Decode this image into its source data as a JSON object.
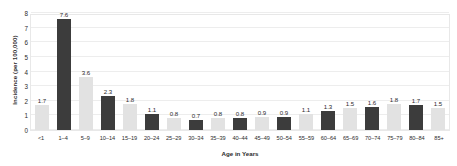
{
  "chart_data": {
    "type": "bar",
    "title": "",
    "xlabel": "Age in Years",
    "ylabel": "Incidence (per 100,000)",
    "ylim": [
      0,
      8
    ],
    "yticks": [
      0,
      1,
      2,
      3,
      4,
      5,
      6,
      7,
      8
    ],
    "grid": true,
    "legend": "none",
    "categories": [
      "<1",
      "1–4",
      "5–9",
      "10–14",
      "15–19",
      "20–24",
      "25–29",
      "30–34",
      "35–39",
      "40–44",
      "45–49",
      "50–54",
      "55–59",
      "60–64",
      "65–69",
      "70–74",
      "75–79",
      "80–84",
      "85+"
    ],
    "values": [
      1.7,
      7.6,
      3.6,
      2.3,
      1.8,
      1.1,
      0.8,
      0.7,
      0.8,
      0.8,
      0.9,
      0.9,
      1.1,
      1.3,
      1.5,
      1.6,
      1.8,
      1.7,
      1.5
    ],
    "bar_colors": [
      "light",
      "dark",
      "light",
      "dark",
      "light",
      "dark",
      "light",
      "dark",
      "light",
      "dark",
      "light",
      "dark",
      "light",
      "dark",
      "light",
      "dark",
      "light",
      "dark",
      "light"
    ],
    "colors": {
      "dark": "#3c3c3c",
      "light": "#e2e2e2",
      "grid": "#ededed",
      "text": "#2b2b2b",
      "plot_border": "#e8e8e8",
      "background": "#ffffff"
    }
  }
}
